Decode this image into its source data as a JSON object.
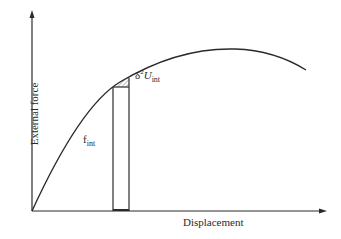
{
  "diagram": {
    "y_axis_label": "External force",
    "x_axis_label": "Displacement",
    "increment_label": {
      "base": "δ",
      "sup": "2",
      "var": "U",
      "sub": "int"
    },
    "force_label": {
      "base": "f",
      "sub": "int"
    },
    "colors": {
      "line": "#2a2a2a",
      "background": "#ffffff"
    }
  }
}
